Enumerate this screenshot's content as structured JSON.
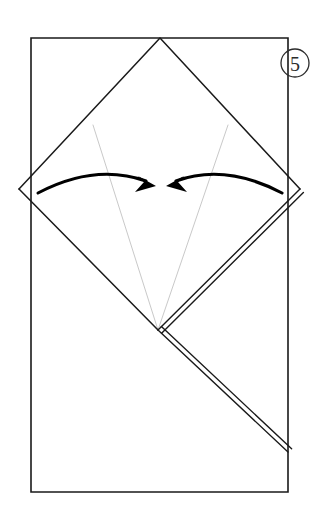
{
  "diagram": {
    "step_badge": {
      "label": "5",
      "shape": "circle",
      "position": "top-right"
    },
    "colors": {
      "background": "#ffffff",
      "paper_outline": "#1a1a1a",
      "fold_line": "#1a1a1a",
      "crease_hint": "#c9c9c9",
      "arrow": "#000000",
      "badge": "#2b2b2b"
    },
    "canvas": {
      "width": 319,
      "height": 515
    },
    "shapes": {
      "sheet_rect": {
        "name": "paper-sheet-rectangle",
        "left": 31,
        "top": 38,
        "right": 288,
        "bottom": 492
      },
      "diamond": {
        "name": "folded-diamond",
        "apex_top": [
          160,
          38
        ],
        "vertex_left": [
          19,
          189
        ],
        "vertex_right": [
          300,
          189
        ],
        "vertex_bottom": [
          158,
          330
        ]
      },
      "crease_left": {
        "name": "left-crease-hint",
        "from": [
          93,
          125
        ],
        "to": [
          158,
          330
        ]
      },
      "crease_right": {
        "name": "right-crease-hint",
        "from": [
          228,
          125
        ],
        "to": [
          158,
          330
        ]
      },
      "layer_upper_right": {
        "name": "upper-right-layer-edge",
        "from": [
          158,
          330
        ],
        "to": [
          300,
          189
        ]
      },
      "layer_lower_right": {
        "name": "lower-right-layer-edge",
        "from": [
          158,
          330
        ],
        "to": [
          288,
          452
        ]
      }
    },
    "arrows": [
      {
        "name": "left-fold-arrow",
        "direction": "right",
        "start": [
          38,
          191
        ],
        "end": [
          150,
          182
        ],
        "description": "Fold left flap inward to the right"
      },
      {
        "name": "right-fold-arrow",
        "direction": "left",
        "start": [
          282,
          191
        ],
        "end": [
          172,
          182
        ],
        "description": "Fold right flap inward to the left"
      }
    ]
  }
}
